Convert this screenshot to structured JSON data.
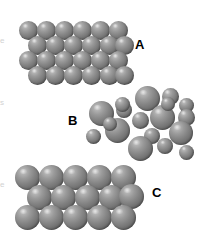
{
  "figure": {
    "background_color": "#ffffff",
    "width": 217,
    "height": 242,
    "sphere_fill_color": "#848484",
    "sphere_highlight_color": "#c9c9c9",
    "sphere_shadow_color": "#515151",
    "label_color": "#000000"
  },
  "labels": {
    "a": "A",
    "b": "B",
    "c": "C"
  },
  "edge_fragments": {
    "frag_top": "e",
    "frag_mid": "s",
    "frag_bottom": "e"
  },
  "chart_data": {
    "type": "diagram",
    "xlabel": "",
    "ylabel": "",
    "structures": [
      {
        "id": "A",
        "label": "A",
        "description": "Close-packed ordered array of uniform small spheres, four staggered rows of six",
        "sphere_count": 24,
        "rows": 4,
        "columns": 6,
        "sphere_diameter_px": 19,
        "sphere_sizes": [
          "uniform"
        ],
        "label_position": {
          "x": 135,
          "y": 38
        },
        "spheres": [
          {
            "cx": 28,
            "cy": 30,
            "r": 9.5
          },
          {
            "cx": 46,
            "cy": 30,
            "r": 9.5
          },
          {
            "cx": 64,
            "cy": 30,
            "r": 9.5
          },
          {
            "cx": 82,
            "cy": 30,
            "r": 9.5
          },
          {
            "cx": 100,
            "cy": 30,
            "r": 9.5
          },
          {
            "cx": 118,
            "cy": 30,
            "r": 9.5
          },
          {
            "cx": 37,
            "cy": 45,
            "r": 9.5
          },
          {
            "cx": 55,
            "cy": 45,
            "r": 9.5
          },
          {
            "cx": 73,
            "cy": 45,
            "r": 9.5
          },
          {
            "cx": 91,
            "cy": 45,
            "r": 9.5
          },
          {
            "cx": 109,
            "cy": 45,
            "r": 9.5
          },
          {
            "cx": 124,
            "cy": 45,
            "r": 9.5
          },
          {
            "cx": 28,
            "cy": 60,
            "r": 9.5
          },
          {
            "cx": 46,
            "cy": 60,
            "r": 9.5
          },
          {
            "cx": 64,
            "cy": 60,
            "r": 9.5
          },
          {
            "cx": 82,
            "cy": 60,
            "r": 9.5
          },
          {
            "cx": 100,
            "cy": 60,
            "r": 9.5
          },
          {
            "cx": 118,
            "cy": 60,
            "r": 9.5
          },
          {
            "cx": 37,
            "cy": 75,
            "r": 9.5
          },
          {
            "cx": 55,
            "cy": 75,
            "r": 9.5
          },
          {
            "cx": 73,
            "cy": 75,
            "r": 9.5
          },
          {
            "cx": 91,
            "cy": 75,
            "r": 9.5
          },
          {
            "cx": 109,
            "cy": 75,
            "r": 9.5
          },
          {
            "cx": 124,
            "cy": 75,
            "r": 9.5
          }
        ]
      },
      {
        "id": "B",
        "label": "B",
        "description": "Disordered cluster mixing large and small spheres, substitutional alloy arrangement",
        "sphere_count": 18,
        "rows": 0,
        "columns": 0,
        "sphere_diameter_px": 22,
        "sphere_sizes": [
          "large",
          "small"
        ],
        "label_position": {
          "x": 68,
          "y": 114
        },
        "spheres": [
          {
            "cx": 147,
            "cy": 98,
            "r": 12.5,
            "size": "large"
          },
          {
            "cx": 170,
            "cy": 96,
            "r": 8.5,
            "size": "small"
          },
          {
            "cx": 186,
            "cy": 105,
            "r": 7.5,
            "size": "small"
          },
          {
            "cx": 101,
            "cy": 113,
            "r": 12.5,
            "size": "large"
          },
          {
            "cx": 124,
            "cy": 110,
            "r": 8.0,
            "size": "small"
          },
          {
            "cx": 162,
            "cy": 117,
            "r": 12.5,
            "size": "large"
          },
          {
            "cx": 186,
            "cy": 117,
            "r": 8.5,
            "size": "small"
          },
          {
            "cx": 140,
            "cy": 120,
            "r": 8.5,
            "size": "small"
          },
          {
            "cx": 117,
            "cy": 130,
            "r": 12.5,
            "size": "large"
          },
          {
            "cx": 181,
            "cy": 133,
            "r": 12.0,
            "size": "large"
          },
          {
            "cx": 93,
            "cy": 136,
            "r": 7.5,
            "size": "small"
          },
          {
            "cx": 152,
            "cy": 136,
            "r": 8.0,
            "size": "small"
          },
          {
            "cx": 140,
            "cy": 148,
            "r": 12.5,
            "size": "large"
          },
          {
            "cx": 165,
            "cy": 146,
            "r": 8.0,
            "size": "small"
          },
          {
            "cx": 186,
            "cy": 152,
            "r": 7.5,
            "size": "small"
          },
          {
            "cx": 122,
            "cy": 104,
            "r": 7.5,
            "size": "small"
          },
          {
            "cx": 110,
            "cy": 124,
            "r": 7.0,
            "size": "small"
          },
          {
            "cx": 168,
            "cy": 104,
            "r": 7.0,
            "size": "small"
          }
        ]
      },
      {
        "id": "C",
        "label": "C",
        "description": "Close-packed ordered array of uniform large spheres, three staggered rows of five",
        "sphere_count": 15,
        "rows": 3,
        "columns": 5,
        "sphere_diameter_px": 25,
        "sphere_sizes": [
          "uniform"
        ],
        "label_position": {
          "x": 152,
          "y": 186
        },
        "spheres": [
          {
            "cx": 27,
            "cy": 177,
            "r": 12.5
          },
          {
            "cx": 51,
            "cy": 177,
            "r": 12.5
          },
          {
            "cx": 75,
            "cy": 177,
            "r": 12.5
          },
          {
            "cx": 99,
            "cy": 177,
            "r": 12.5
          },
          {
            "cx": 123,
            "cy": 177,
            "r": 12.5
          },
          {
            "cx": 39,
            "cy": 197,
            "r": 12.5
          },
          {
            "cx": 63,
            "cy": 197,
            "r": 12.5
          },
          {
            "cx": 87,
            "cy": 197,
            "r": 12.5
          },
          {
            "cx": 111,
            "cy": 197,
            "r": 12.5
          },
          {
            "cx": 131,
            "cy": 196,
            "r": 12.5
          },
          {
            "cx": 27,
            "cy": 217,
            "r": 12.5
          },
          {
            "cx": 51,
            "cy": 217,
            "r": 12.5
          },
          {
            "cx": 75,
            "cy": 217,
            "r": 12.5
          },
          {
            "cx": 99,
            "cy": 217,
            "r": 12.5
          },
          {
            "cx": 123,
            "cy": 217,
            "r": 12.5
          }
        ]
      }
    ]
  }
}
